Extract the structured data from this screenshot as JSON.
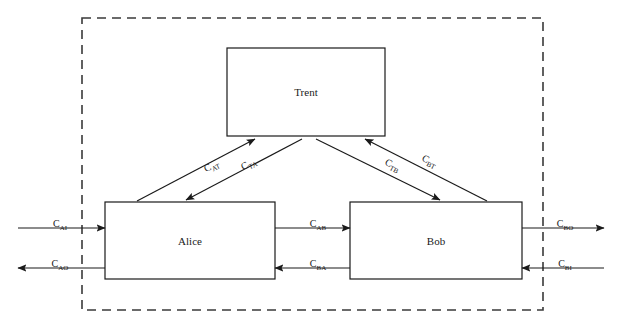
{
  "diagram": {
    "boundary": {
      "name": "trusted-boundary",
      "style": "dashed",
      "color": "#3a3a3a"
    },
    "nodes": [
      {
        "id": "trent",
        "label": "Trent",
        "x": 227,
        "y": 48,
        "w": 158,
        "h": 88
      },
      {
        "id": "alice",
        "label": "Alice",
        "x": 105,
        "y": 202,
        "w": 170,
        "h": 77
      },
      {
        "id": "bob",
        "label": "Bob",
        "x": 350,
        "y": 202,
        "w": 172,
        "h": 77
      }
    ],
    "edges": [
      {
        "id": "a-to-t",
        "label_base": "C",
        "label_sub": "AT",
        "from": "alice",
        "to": "trent",
        "label_x": 212,
        "label_y": 167
      },
      {
        "id": "t-to-a",
        "label_base": "C",
        "label_sub": "TA",
        "from": "trent",
        "to": "alice",
        "label_x": 249,
        "label_y": 165
      },
      {
        "id": "t-to-b",
        "label_base": "C",
        "label_sub": "TB",
        "from": "trent",
        "to": "bob",
        "label_x": 392,
        "label_y": 166
      },
      {
        "id": "b-to-t",
        "label_base": "C",
        "label_sub": "BT",
        "from": "bob",
        "to": "trent",
        "label_x": 429,
        "label_y": 162
      },
      {
        "id": "a-to-b",
        "label_base": "C",
        "label_sub": "AB",
        "from": "alice",
        "to": "bob",
        "label_x": 318,
        "label_y": 228
      },
      {
        "id": "b-to-a",
        "label_base": "C",
        "label_sub": "BA",
        "from": "bob",
        "to": "alice",
        "label_x": 318,
        "label_y": 268
      },
      {
        "id": "ext-in-alice",
        "label_base": "C",
        "label_sub": "AI",
        "from": "external",
        "to": "alice",
        "label_x": 60,
        "label_y": 228
      },
      {
        "id": "ext-out-alice",
        "label_base": "C",
        "label_sub": "AO",
        "from": "alice",
        "to": "external",
        "label_x": 60,
        "label_y": 268
      },
      {
        "id": "ext-out-bob",
        "label_base": "C",
        "label_sub": "BO",
        "from": "bob",
        "to": "external",
        "label_x": 565,
        "label_y": 228
      },
      {
        "id": "ext-in-bob",
        "label_base": "C",
        "label_sub": "BI",
        "from": "external",
        "to": "bob",
        "label_x": 565,
        "label_y": 268
      }
    ]
  }
}
